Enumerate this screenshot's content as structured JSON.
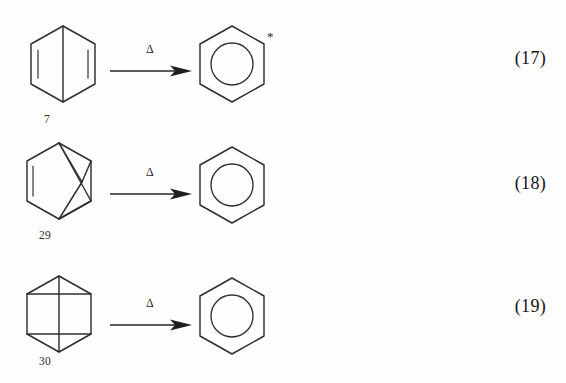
{
  "document": {
    "type": "chemistry-reaction-scheme",
    "description": "Thermal isomerization of benzene valence isomers to benzene",
    "background_color": "#fefefe",
    "line_color": "#2e2e2e"
  },
  "equations": [
    {
      "id": "eq-17",
      "number": "(17)",
      "reactant": {
        "compound_number": "7",
        "name": "dewar-benzene",
        "skeleton": "hexagon-with-central-vertical-bond-and-two-double-bonds"
      },
      "arrow": {
        "label": "Δ",
        "label_name": "delta-heat-symbol",
        "direction": "right"
      },
      "product": {
        "name": "benzene",
        "skeleton": "hexagon-with-inscribed-circle",
        "annotation": "*",
        "annotation_name": "asterisk-label"
      }
    },
    {
      "id": "eq-18",
      "number": "(18)",
      "reactant": {
        "compound_number": "29",
        "name": "benzvalene",
        "skeleton": "hexagon-with-diagonal-cage-bonds-and-left-double-bond"
      },
      "arrow": {
        "label": "Δ",
        "label_name": "delta-heat-symbol",
        "direction": "right"
      },
      "product": {
        "name": "benzene",
        "skeleton": "hexagon-with-inscribed-circle",
        "annotation": "",
        "annotation_name": "none"
      }
    },
    {
      "id": "eq-19",
      "number": "(19)",
      "reactant": {
        "compound_number": "30",
        "name": "prismane",
        "skeleton": "hexagon-with-two-horizontal-bonds-and-central-vertical-bond"
      },
      "arrow": {
        "label": "Δ",
        "label_name": "delta-heat-symbol",
        "direction": "right"
      },
      "product": {
        "name": "benzene",
        "skeleton": "hexagon-with-inscribed-circle",
        "annotation": "",
        "annotation_name": "none"
      }
    }
  ]
}
